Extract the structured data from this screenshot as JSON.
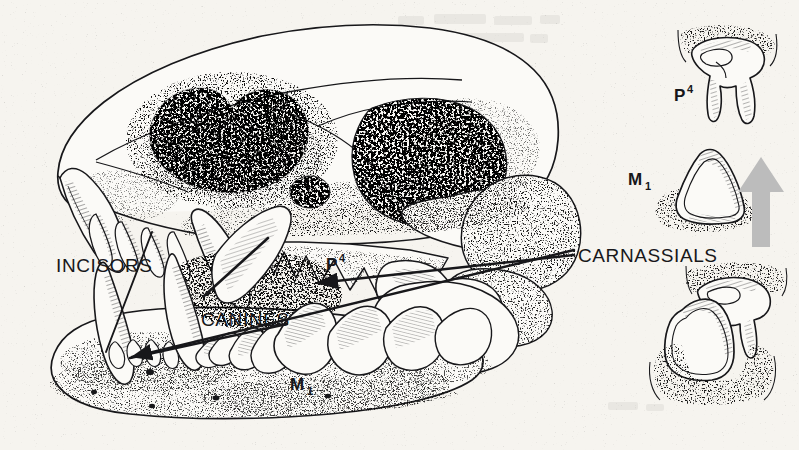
{
  "figure": {
    "kind": "anatomical-illustration",
    "technique": "pen-and-ink stipple drawing",
    "background_color": "#f6f4ef",
    "ink_color": "#17171a",
    "arrow_color": "#b9b9b9"
  },
  "labels": {
    "incisors": "INCISORS",
    "canines": "CANINES",
    "carnassials": "CARNASSIALS",
    "upper_carnassial": "P",
    "upper_carnassial_sup": "4",
    "lower_carnassial": "M",
    "lower_carnassial_sub": "1",
    "inset_upper_carnassial": "P",
    "inset_upper_carnassial_sup": "4",
    "inset_lower_carnassial": "M",
    "inset_lower_carnassial_sub": "1"
  },
  "insets": {
    "top": {
      "name": "upper-carnassial-tooth",
      "label": "P4",
      "description": "isolated upper fourth premolar in gum socket"
    },
    "middle": {
      "name": "lower-carnassial-tooth",
      "label": "M1",
      "description": "isolated lower first molar in gum socket"
    },
    "bottom": {
      "name": "carnassial-pair-occlusion",
      "label": "",
      "description": "upper and lower carnassials shearing past one another"
    },
    "arrow": {
      "name": "up-arrow",
      "direction": "up",
      "color": "#b9b9b9"
    }
  },
  "leaders": [
    {
      "from": "INCISORS",
      "to": "incisor row"
    },
    {
      "from": "CANINES",
      "to": "upper canine"
    },
    {
      "from": "CANINES",
      "to": "lower canine"
    },
    {
      "from": "CARNASSIALS",
      "to": "P4 upper carnassial"
    },
    {
      "from": "CARNASSIALS",
      "to": "M1 lower carnassial"
    }
  ]
}
